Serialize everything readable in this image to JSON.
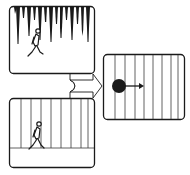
{
  "diagram": {
    "type": "illustration",
    "colors": {
      "ink": "#1a1a1a",
      "paper": "#ffffff",
      "stripe": "#3a3a3a"
    },
    "panels": [
      {
        "id": "forest-scene",
        "label": "figure walking among trees",
        "x": 9,
        "y": 6,
        "w": 86,
        "h": 68,
        "contents": [
          "hanging-trees",
          "walking-person"
        ]
      },
      {
        "id": "striped-scene",
        "label": "figure walking in front of vertical stripes",
        "x": 9,
        "y": 98,
        "w": 86,
        "h": 70,
        "stripe_count": 8,
        "ground_line_y": 148,
        "contents": [
          "vertical-stripes",
          "ground-line",
          "walking-person"
        ]
      },
      {
        "id": "abstract-scene",
        "label": "dot moving right over vertical stripes",
        "x": 103,
        "y": 54,
        "w": 82,
        "h": 66,
        "stripe_count": 8,
        "contents": [
          "vertical-stripes",
          "black-dot",
          "motion-arrow"
        ]
      }
    ],
    "connector": {
      "type": "merging-arrow",
      "from": [
        "forest-scene",
        "striped-scene"
      ],
      "to": "abstract-scene"
    }
  }
}
